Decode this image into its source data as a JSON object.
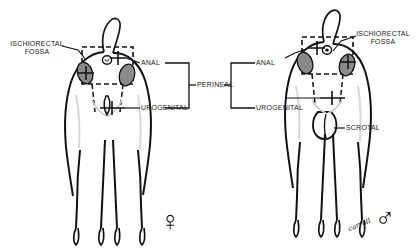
{
  "figure": {
    "type": "anatomical-diagram",
    "panels": [
      "female",
      "male"
    ],
    "signature": "carroll"
  },
  "colors": {
    "ink": "#111111",
    "fossa_fill": "#8a8a8a",
    "shading": "#cfcfcf",
    "background": "#ffffff"
  },
  "left_panel": {
    "sex": "female",
    "sex_symbol": "♀",
    "labels": {
      "fossa_line1": "ISCHIORECTAL",
      "fossa_line2": "FOSSA",
      "anal": "ANAL",
      "urogenital": "UROGENITAL"
    }
  },
  "right_panel": {
    "sex": "male",
    "sex_symbol": "♂",
    "labels": {
      "fossa_line1": "ISCHIORECTAL",
      "fossa_line2": "FOSSA",
      "anal": "ANAL",
      "urogenital": "UROGENITAL",
      "scrotal": "SCROTAL"
    }
  },
  "center": {
    "perineal": "PERINEAL"
  }
}
